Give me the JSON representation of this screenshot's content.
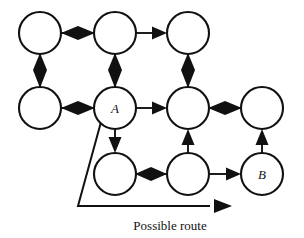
{
  "figure": {
    "kind": "node-link-grid-diagram",
    "width": 304,
    "height": 238,
    "background_color": "#ffffff",
    "ink_color": "#111111"
  },
  "nodes": [
    {
      "id": "r1c1",
      "label": "",
      "cx": 40,
      "cy": 33,
      "r": 21
    },
    {
      "id": "r1c2",
      "label": "",
      "cx": 115,
      "cy": 33,
      "r": 21
    },
    {
      "id": "r1c3",
      "label": "",
      "cx": 188,
      "cy": 33,
      "r": 21
    },
    {
      "id": "r2c1",
      "label": "",
      "cx": 40,
      "cy": 108,
      "r": 21
    },
    {
      "id": "r2c2",
      "label": "A",
      "cx": 115,
      "cy": 108,
      "r": 21
    },
    {
      "id": "r2c3",
      "label": "",
      "cx": 188,
      "cy": 108,
      "r": 21
    },
    {
      "id": "r2c4",
      "label": "",
      "cx": 262,
      "cy": 108,
      "r": 21
    },
    {
      "id": "r3c2",
      "label": "",
      "cx": 115,
      "cy": 174,
      "r": 21
    },
    {
      "id": "r3c3",
      "label": "",
      "cx": 188,
      "cy": 174,
      "r": 21
    },
    {
      "id": "r3c4",
      "label": "B",
      "cx": 262,
      "cy": 174,
      "r": 21
    }
  ],
  "node_labels": {
    "r2c2": "A",
    "r3c4": "B"
  },
  "edges": [
    {
      "id": "e-r1c1-r1c2",
      "from": "r1c1",
      "to": "r1c2",
      "direction": "both",
      "orientation": "horizontal"
    },
    {
      "id": "e-r1c2-r1c3",
      "from": "r1c2",
      "to": "r1c3",
      "direction": "forward",
      "orientation": "horizontal"
    },
    {
      "id": "e-r1c1-r2c1",
      "from": "r1c1",
      "to": "r2c1",
      "direction": "both",
      "orientation": "vertical"
    },
    {
      "id": "e-r1c2-r2c2",
      "from": "r1c2",
      "to": "r2c2",
      "direction": "both",
      "orientation": "vertical"
    },
    {
      "id": "e-r1c3-r2c3",
      "from": "r1c3",
      "to": "r2c3",
      "direction": "both",
      "orientation": "vertical"
    },
    {
      "id": "e-r2c1-r2c2",
      "from": "r2c1",
      "to": "r2c2",
      "direction": "both",
      "orientation": "horizontal"
    },
    {
      "id": "e-r2c2-r2c3",
      "from": "r2c2",
      "to": "r2c3",
      "direction": "forward",
      "orientation": "horizontal"
    },
    {
      "id": "e-r2c3-r2c4",
      "from": "r2c3",
      "to": "r2c4",
      "direction": "both",
      "orientation": "horizontal"
    },
    {
      "id": "e-r2c2-r3c2",
      "from": "r2c2",
      "to": "r3c2",
      "direction": "down",
      "orientation": "vertical"
    },
    {
      "id": "e-r3c3-r2c3",
      "from": "r3c3",
      "to": "r2c3",
      "direction": "up",
      "orientation": "vertical"
    },
    {
      "id": "e-r3c4-r2c4",
      "from": "r3c4",
      "to": "r2c4",
      "direction": "up",
      "orientation": "vertical"
    },
    {
      "id": "e-r3c2-r3c3",
      "from": "r3c2",
      "to": "r3c3",
      "direction": "both",
      "orientation": "horizontal"
    },
    {
      "id": "e-r3c3-r3c4",
      "from": "r3c3",
      "to": "r3c4",
      "direction": "forward",
      "orientation": "horizontal"
    }
  ],
  "route": {
    "caption": "Possible route",
    "caption_x": 170,
    "caption_y": 230,
    "path_points": "101,122 78,206 210,206",
    "arrow_tip_x": 232,
    "arrow_tip_y": 206
  }
}
